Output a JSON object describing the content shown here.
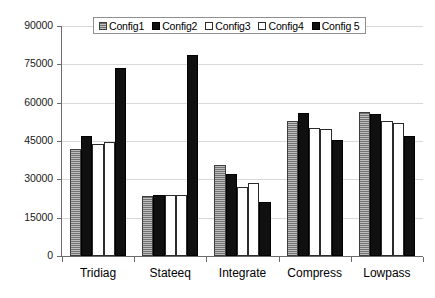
{
  "chart_data": {
    "type": "bar",
    "title": "",
    "subtitle": "",
    "xlabel": "",
    "ylabel": "",
    "categories": [
      "Tridiag",
      "Stateeq",
      "Integrate",
      "Compress",
      "Lowpass"
    ],
    "series": [
      {
        "name": "Config1",
        "values": [
          42000,
          23500,
          35500,
          53000,
          56500
        ],
        "fill": "textured-gray",
        "color": "#8a8a8a"
      },
      {
        "name": "Config2",
        "values": [
          47000,
          24000,
          32000,
          56000,
          55500
        ],
        "fill": "solid-black",
        "color": "#101010"
      },
      {
        "name": "Config3",
        "values": [
          44000,
          23800,
          27000,
          50000,
          53000
        ],
        "fill": "white-outline",
        "color": "#ffffff"
      },
      {
        "name": "Config4",
        "values": [
          44500,
          23800,
          28500,
          49800,
          52000
        ],
        "fill": "white-outline",
        "color": "#ffffff"
      },
      {
        "name": "Config 5",
        "values": [
          73500,
          78500,
          21000,
          45500,
          47000
        ],
        "fill": "solid-black",
        "color": "#101010"
      }
    ],
    "ylim": [
      0,
      90000
    ],
    "yticks": [
      0,
      15000,
      30000,
      45000,
      60000,
      75000,
      90000
    ],
    "ytick_labels": [
      "0",
      "15000",
      "30000",
      "45000",
      "60000",
      "75000",
      "90000"
    ],
    "grid": "horizontal",
    "legend_position": "top-center",
    "legend_labels": [
      "Config1",
      "Config2",
      "Config3",
      "Config4",
      "Config 5"
    ]
  }
}
